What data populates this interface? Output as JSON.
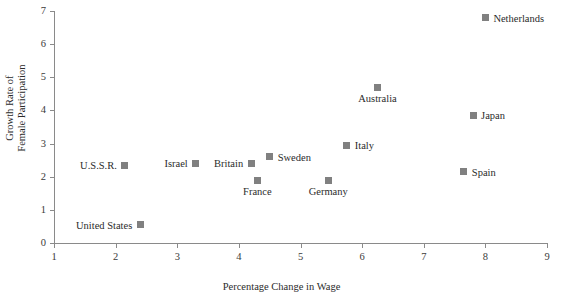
{
  "chart_data": {
    "type": "scatter",
    "title": "",
    "xlabel": "Percentage Change in Wage",
    "ylabel": "Growth Rate of Female Participation",
    "ylabel_line1": "Growth Rate of",
    "ylabel_line2": "Female Participation",
    "xlim": [
      1,
      9
    ],
    "ylim": [
      0,
      7
    ],
    "xticks": [
      1,
      2,
      3,
      4,
      5,
      6,
      7,
      8,
      9
    ],
    "yticks": [
      0,
      1,
      2,
      3,
      4,
      5,
      6,
      7
    ],
    "xticklabels": [
      "1",
      "2",
      "3",
      "4",
      "5",
      "6",
      "7",
      "8",
      "9"
    ],
    "yticklabels": [
      "0",
      "1",
      "2",
      "3",
      "4",
      "5",
      "6",
      "7"
    ],
    "grid": false,
    "legend": "none",
    "marker_color": "#808080",
    "marker_shape": "square",
    "points": [
      {
        "label": "Netherlands",
        "x": 8.0,
        "y": 6.8,
        "label_pos": "right"
      },
      {
        "label": "Australia",
        "x": 6.25,
        "y": 4.7,
        "label_pos": "below"
      },
      {
        "label": "Japan",
        "x": 7.8,
        "y": 3.85,
        "label_pos": "right"
      },
      {
        "label": "Italy",
        "x": 5.75,
        "y": 2.95,
        "label_pos": "right"
      },
      {
        "label": "Sweden",
        "x": 4.5,
        "y": 2.6,
        "label_pos": "right"
      },
      {
        "label": "Britain",
        "x": 4.2,
        "y": 2.4,
        "label_pos": "left"
      },
      {
        "label": "Israel",
        "x": 3.3,
        "y": 2.4,
        "label_pos": "left"
      },
      {
        "label": "U.S.S.R.",
        "x": 2.15,
        "y": 2.35,
        "label_pos": "left"
      },
      {
        "label": "Spain",
        "x": 7.65,
        "y": 2.15,
        "label_pos": "right"
      },
      {
        "label": "France",
        "x": 4.3,
        "y": 1.9,
        "label_pos": "below"
      },
      {
        "label": "Germany",
        "x": 5.45,
        "y": 1.9,
        "label_pos": "below"
      },
      {
        "label": "United States",
        "x": 2.4,
        "y": 0.55,
        "label_pos": "left"
      }
    ]
  }
}
